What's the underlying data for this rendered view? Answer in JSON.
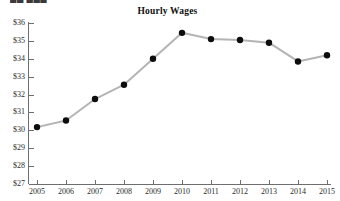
{
  "header": {
    "cropped_text": "██ ███"
  },
  "chart_data": {
    "type": "line",
    "title": "Hourly Wages",
    "xlabel": "",
    "ylabel": "",
    "categories": [
      "2005",
      "2006",
      "2007",
      "2008",
      "2009",
      "2010",
      "2011",
      "2012",
      "2013",
      "2014",
      "2015"
    ],
    "x": [
      2005,
      2006,
      2007,
      2008,
      2009,
      2010,
      2011,
      2012,
      2013,
      2014,
      2015
    ],
    "values": [
      30.18,
      30.55,
      31.75,
      32.55,
      34.0,
      35.45,
      35.1,
      35.05,
      34.9,
      33.85,
      34.2
    ],
    "ylim": [
      27,
      36
    ],
    "xlim": [
      2005,
      2015
    ],
    "ytick_labels": [
      "$36",
      "$35",
      "$34",
      "$33",
      "$32",
      "$31",
      "$30",
      "$29",
      "$28",
      "$27"
    ],
    "ytick_values": [
      36,
      35,
      34,
      33,
      32,
      31,
      30,
      29,
      28,
      27
    ],
    "xtick_labels": [
      "2005",
      "2006",
      "2007",
      "2008",
      "2009",
      "2010",
      "2011",
      "2012",
      "2013",
      "2014",
      "2015"
    ],
    "grid": false,
    "legend": null,
    "series_name": "Hourly Wages",
    "line_color": "#b4b4b4",
    "marker_color": "#0d0d0d",
    "axis_color": "#6e6e6e"
  }
}
